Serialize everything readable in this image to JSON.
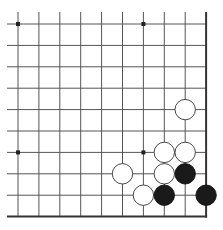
{
  "board": {
    "title": "Go board diagram (lower-right corner)",
    "cols": 10,
    "rows": 10,
    "origin_x": 18,
    "origin_y": 24,
    "spacing_x": 20.9,
    "spacing_y": 21.4,
    "line_color": "#555555",
    "border_color": "#333333",
    "star_points": [
      {
        "col": 0,
        "row": 0
      },
      {
        "col": 6,
        "row": 0
      },
      {
        "col": 0,
        "row": 6
      },
      {
        "col": 6,
        "row": 6
      }
    ],
    "stones": [
      {
        "color": "white",
        "col": 8,
        "row": 4
      },
      {
        "color": "white",
        "col": 7,
        "row": 6
      },
      {
        "color": "white",
        "col": 8,
        "row": 6
      },
      {
        "color": "white",
        "col": 5,
        "row": 7
      },
      {
        "color": "white",
        "col": 7,
        "row": 7
      },
      {
        "color": "black",
        "col": 8,
        "row": 7
      },
      {
        "color": "white",
        "col": 6,
        "row": 8
      },
      {
        "color": "black",
        "col": 7,
        "row": 8
      },
      {
        "color": "black",
        "col": 9,
        "row": 8
      }
    ]
  }
}
